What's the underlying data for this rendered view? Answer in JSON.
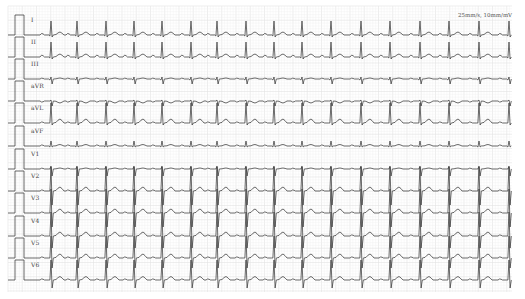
{
  "speed_label": "25mm/s, 10mm/mV",
  "colors": {
    "background": "#ffffff",
    "grid_minor": "#f1f1f1",
    "grid_major": "#e2e2e2",
    "trace": "#3a3a3a"
  },
  "chart_data": {
    "type": "line",
    "annotation": "25mm/s, 10mm/mV",
    "paper_speed": "25mm/s",
    "gain": "10mm/mV",
    "grid": true,
    "leads": [
      "I",
      "II",
      "III",
      "aVR",
      "aVL",
      "aVF",
      "V1",
      "V2",
      "V3",
      "V4",
      "V5",
      "V6"
    ],
    "beat_x_px": [
      51,
      77,
      106,
      134,
      162,
      191,
      217,
      246,
      274,
      302,
      331,
      361,
      390,
      420,
      449,
      479,
      509
    ],
    "series": [
      {
        "name": "I",
        "baseline_y": 35,
        "r": 14,
        "q": 1,
        "s": 2,
        "t": 3,
        "p": 1.5
      },
      {
        "name": "II",
        "baseline_y": 57,
        "r": 15,
        "q": 1,
        "s": 2,
        "t": 3,
        "p": 1.8
      },
      {
        "name": "III",
        "baseline_y": 79,
        "r": 2,
        "q": 1,
        "s": 5,
        "t": 1,
        "p": 0.8
      },
      {
        "name": "aVR",
        "baseline_y": 101,
        "r": 1,
        "q": 0,
        "s": 5,
        "t": -2,
        "p": -1
      },
      {
        "name": "aVL",
        "baseline_y": 123,
        "r": 20,
        "q": 0,
        "s": 2,
        "t": 4,
        "p": 1
      },
      {
        "name": "aVF",
        "baseline_y": 146,
        "r": 5,
        "q": 1,
        "s": 1,
        "t": 1.5,
        "p": 1
      },
      {
        "name": "V1",
        "baseline_y": 169,
        "r": 3,
        "q": 0,
        "s": 7,
        "t": 1,
        "p": 0.8
      },
      {
        "name": "V2",
        "baseline_y": 191,
        "r": 24,
        "q": 0,
        "s": 14,
        "t": 4,
        "p": 1
      },
      {
        "name": "V3",
        "baseline_y": 213,
        "r": 24,
        "q": 0,
        "s": 14,
        "t": 4,
        "p": 1
      },
      {
        "name": "V4",
        "baseline_y": 236,
        "r": 24,
        "q": 0,
        "s": 12,
        "t": 4,
        "p": 1
      },
      {
        "name": "V5",
        "baseline_y": 258,
        "r": 22,
        "q": 0,
        "s": 10,
        "t": 4,
        "p": 1
      },
      {
        "name": "V6",
        "baseline_y": 280,
        "r": 20,
        "q": 0,
        "s": 8,
        "t": 3.5,
        "p": 1
      }
    ],
    "calibration_pulse": {
      "x_start": 15,
      "x_end": 24,
      "height_px": 20
    },
    "trace_x_range": [
      8,
      509
    ],
    "xlabel": "",
    "ylabel": ""
  }
}
